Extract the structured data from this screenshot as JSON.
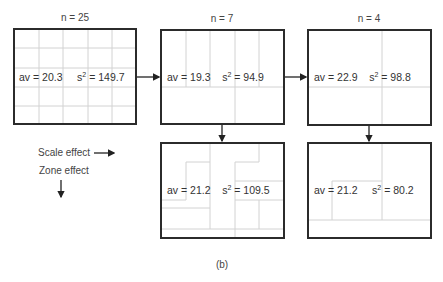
{
  "diagram": {
    "caption": "(b)",
    "legend": {
      "scale_effect": "Scale effect",
      "zone_effect": "Zone effect"
    },
    "top_row": [
      {
        "n_label": "n = 25",
        "av_label": "av = ",
        "av": "20.3",
        "s2_label": "s",
        "s2_sup": "2",
        "s2_eq": " = ",
        "s2": "149.7"
      },
      {
        "n_label": "n = 7",
        "av_label": "av = ",
        "av": "19.3",
        "s2_label": "s",
        "s2_sup": "2",
        "s2_eq": " = ",
        "s2": "94.9"
      },
      {
        "n_label": "n = 4",
        "av_label": "av = ",
        "av": "22.9",
        "s2_label": "s",
        "s2_sup": "2",
        "s2_eq": " = ",
        "s2": "98.8"
      }
    ],
    "bottom_row": [
      {
        "av_label": "av = ",
        "av": "21.2",
        "s2_label": "s",
        "s2_sup": "2",
        "s2_eq": " = ",
        "s2": "109.5"
      },
      {
        "av_label": "av = ",
        "av": "21.2",
        "s2_label": "s",
        "s2_sup": "2",
        "s2_eq": " = ",
        "s2": "80.2"
      }
    ],
    "colors": {
      "box_border": "#2b2b2b",
      "grid_line": "#cfcfcf",
      "arrow": "#222222"
    }
  }
}
